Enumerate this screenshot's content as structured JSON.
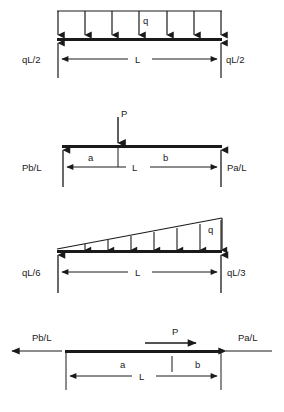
{
  "document": {
    "title": "Beam Loading and Support Reaction Diagrams",
    "figure_count": 4,
    "line_color": "#1a1a1a",
    "background_color": "#ffffff"
  },
  "figures": [
    {
      "id": "uniformly-distributed-load",
      "name": "Simply supported beam with uniformly distributed load",
      "load_type": "uniform-distributed",
      "load_label": "q",
      "load_arrow_count": 7,
      "span_label": "L",
      "left_reaction": "qL/2",
      "right_reaction": "qL/2",
      "reaction_direction": "up"
    },
    {
      "id": "point-load-vertical",
      "name": "Simply supported beam with vertical point load",
      "load_type": "point",
      "load_label": "P",
      "load_direction": "down",
      "segment_left_label": "a",
      "segment_right_label": "b",
      "span_label": "L",
      "left_reaction": "Pb/L",
      "right_reaction": "Pa/L",
      "reaction_direction": "up"
    },
    {
      "id": "triangular-distributed-load",
      "name": "Simply supported beam with triangular (linearly varying) distributed load",
      "load_type": "triangular-distributed",
      "load_label": "q",
      "load_arrow_count": 7,
      "span_label": "L",
      "left_reaction": "qL/6",
      "right_reaction": "qL/3",
      "reaction_direction": "up"
    },
    {
      "id": "point-load-axial",
      "name": "Beam with horizontal axial point load",
      "load_type": "point-axial",
      "load_label": "P",
      "load_direction": "right",
      "segment_left_label": "a",
      "segment_right_label": "b",
      "span_label": "L",
      "left_reaction": "Pb/L",
      "right_reaction": "Pa/L",
      "reaction_direction": "horizontal"
    }
  ]
}
